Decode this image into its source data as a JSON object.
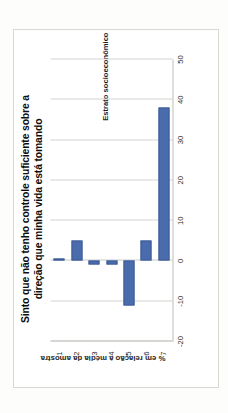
{
  "figure": {
    "title_line1": "Sinto que não tenho controle suficiente sobre a",
    "title_line2": "direção que minha vida está tomando",
    "title_full": "Sinto que não tenho controle suficiente sobre a direção que minha vida está tomando",
    "orientation": "rotated-90-ccw",
    "bar_color": "#4a6cad",
    "bar_border_color": "#3c5b96",
    "gridline_color": "#d4d4d0",
    "frame_color": "#d8d8d4",
    "background": "#ffffff"
  },
  "chart_data": {
    "type": "bar",
    "title": "Sinto que não tenho controle suficiente sobre a direção que minha vida está tomando",
    "xlabel": "Estrato socioeconômico",
    "ylabel": "% em relação à média da amostra",
    "categories": [
      "1",
      "2",
      "3",
      "4",
      "5",
      "6",
      "7"
    ],
    "values": [
      0,
      5,
      -1,
      -1,
      -11,
      5,
      38
    ],
    "ylim": [
      -20,
      50
    ],
    "yticks": [
      50,
      40,
      30,
      20,
      10,
      0,
      -10,
      -20
    ],
    "ytick_labels": [
      "50",
      "40",
      "30",
      "20",
      "10",
      "0",
      "-10",
      "-20"
    ],
    "grid": true,
    "legend": false,
    "series": [
      {
        "name": "% em relação à média da amostra",
        "values": [
          0,
          5,
          -1,
          -1,
          -11,
          5,
          38
        ]
      }
    ]
  }
}
